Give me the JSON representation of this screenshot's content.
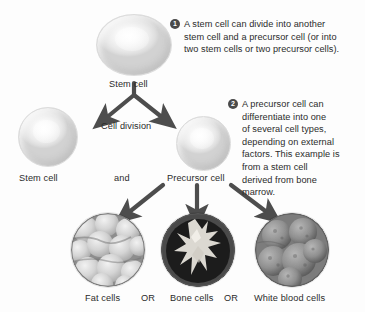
{
  "figure": {
    "background_color": "#fdfdfd",
    "text_color": "#2b2b2b",
    "badge_color": "#4a4a4a",
    "arrow_color": "#4d4d4d"
  },
  "nodes": {
    "top_stem_cell": {
      "label": "Stem cell",
      "icon": "cell-sphere-icon"
    },
    "left_stem_cell": {
      "label": "Stem cell",
      "icon": "cell-sphere-icon"
    },
    "precursor_cell": {
      "label": "Precursor cell",
      "icon": "cell-sphere-icon"
    }
  },
  "connectors": {
    "division_label": "Cell division",
    "and_label": "and",
    "or_label_1": "OR",
    "or_label_2": "OR"
  },
  "callouts": [
    {
      "number": "1",
      "text": "A stem cell can divide into another stem cell and a precursor cell (or into two stem cells or two precursor cells).",
      "lines": [
        "A stem cell can divide into another",
        "stem cell and a precursor cell (or into",
        "two stem cells or two precursor cells)."
      ]
    },
    {
      "number": "2",
      "text": "A precursor cell can differentiate into one of several cell types, depending on external factors. This example is from a stem cell derived from bone marrow.",
      "lines": [
        "A precursor cell can",
        "differentiate into one",
        "of several cell types,",
        "depending on external",
        "factors. This example is",
        "from a stem cell",
        "derived from bone",
        "marrow."
      ]
    }
  ],
  "outcomes": [
    {
      "label": "Fat cells",
      "icon": "fat-cells-micrograph-icon"
    },
    {
      "label": "Bone cells",
      "icon": "bone-cells-micrograph-icon"
    },
    {
      "label": "White blood cells",
      "icon": "white-blood-cells-micrograph-icon"
    }
  ]
}
